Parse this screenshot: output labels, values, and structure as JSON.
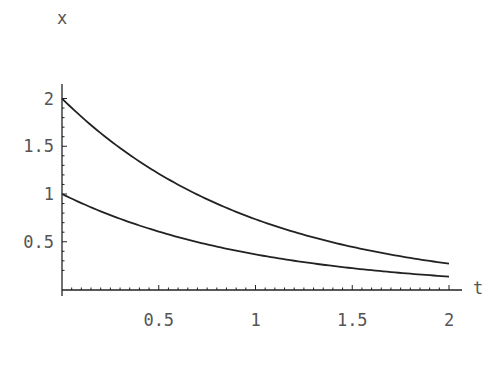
{
  "chart_data": {
    "type": "line",
    "title": "",
    "xlabel": "t",
    "ylabel": "x",
    "xlim": [
      0,
      2
    ],
    "ylim": [
      0.17,
      2
    ],
    "x_ticks": [
      "0.5",
      "1",
      "1.5",
      "2"
    ],
    "y_ticks": [
      "0.5",
      "1",
      "1.5",
      "2"
    ],
    "grid": false,
    "legend": null,
    "series": [
      {
        "name": "x(0)=2",
        "formula": "2*exp(-t)",
        "x": [
          0,
          0.25,
          0.5,
          0.75,
          1,
          1.25,
          1.5,
          1.75,
          2
        ],
        "values": [
          2.0,
          1.558,
          1.213,
          0.945,
          0.736,
          0.573,
          0.446,
          0.348,
          0.271
        ]
      },
      {
        "name": "x(0)=1",
        "formula": "exp(-t)",
        "x": [
          0,
          0.25,
          0.5,
          0.75,
          1,
          1.25,
          1.5,
          1.75,
          2
        ],
        "values": [
          1.0,
          0.779,
          0.607,
          0.472,
          0.368,
          0.287,
          0.223,
          0.174,
          0.135
        ]
      }
    ],
    "color": "#222222"
  }
}
